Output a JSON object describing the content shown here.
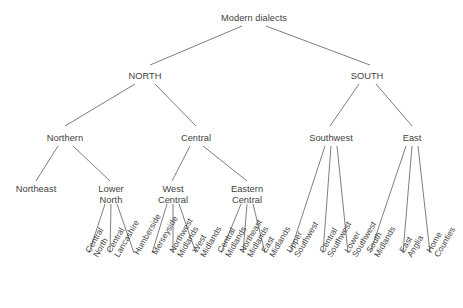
{
  "diagram": {
    "type": "tree",
    "title": "Modern dialects",
    "background_color": "#ffffff",
    "line_color": "#6f6f6f",
    "text_color": "#3f3f3f",
    "leaf_label_rotation_deg": -60,
    "nodes": {
      "root": "Modern dialects",
      "level2": [
        "NORTH",
        "SOUTH"
      ],
      "level3": [
        "Northern",
        "Central",
        "Southwest",
        "East"
      ],
      "level4": [
        "Northeast",
        "Lower North",
        "West Central",
        "Eastern Central"
      ],
      "level4_lines": {
        "northeast": [
          "Northeast"
        ],
        "lower_north": [
          "Lower",
          "North"
        ],
        "west_central": [
          "West",
          "Central"
        ],
        "eastern_central": [
          "Eastern",
          "Central"
        ]
      },
      "leaves": [
        "Central North",
        "Central Lancashire",
        "Humberside",
        "Merseyside",
        "Northwest Midlands",
        "West Midlands",
        "Central Midlands",
        "Northeast Midlands",
        "East Midlands",
        "Upper Southwest",
        "Central Southwest",
        "Lower Southwest",
        "South Midlands",
        "East Anglia",
        "Home Counties"
      ],
      "leaf_lines": [
        [
          "Central",
          "North"
        ],
        [
          "Central",
          "Lancashire"
        ],
        [
          "Humberside"
        ],
        [
          "Merseyside"
        ],
        [
          "Northwest",
          "Midlands"
        ],
        [
          "West",
          "Midlands"
        ],
        [
          "Central",
          "Midlands"
        ],
        [
          "Northeast",
          "Midlands"
        ],
        [
          "East",
          "Midlands"
        ],
        [
          "Upper",
          "Southwest"
        ],
        [
          "Central",
          "Southwest"
        ],
        [
          "Lower",
          "Southwest"
        ],
        [
          "South",
          "Midlands"
        ],
        [
          "East",
          "Anglia"
        ],
        [
          "Home",
          "Counties"
        ]
      ]
    },
    "edges": [
      [
        "Modern dialects",
        "NORTH"
      ],
      [
        "Modern dialects",
        "SOUTH"
      ],
      [
        "NORTH",
        "Northern"
      ],
      [
        "NORTH",
        "Central"
      ],
      [
        "SOUTH",
        "Southwest"
      ],
      [
        "SOUTH",
        "East"
      ],
      [
        "Northern",
        "Northeast"
      ],
      [
        "Northern",
        "Lower North"
      ],
      [
        "Central",
        "West Central"
      ],
      [
        "Central",
        "Eastern Central"
      ],
      [
        "Lower North",
        "Central North"
      ],
      [
        "Lower North",
        "Central Lancashire"
      ],
      [
        "Lower North",
        "Humberside"
      ],
      [
        "West Central",
        "Merseyside"
      ],
      [
        "West Central",
        "Northwest Midlands"
      ],
      [
        "West Central",
        "West Midlands"
      ],
      [
        "Eastern Central",
        "Central Midlands"
      ],
      [
        "Eastern Central",
        "Northeast Midlands"
      ],
      [
        "Eastern Central",
        "East Midlands"
      ],
      [
        "Southwest",
        "Upper Southwest"
      ],
      [
        "Southwest",
        "Central Southwest"
      ],
      [
        "Southwest",
        "Lower Southwest"
      ],
      [
        "East",
        "South Midlands"
      ],
      [
        "East",
        "East Anglia"
      ],
      [
        "East",
        "Home Counties"
      ]
    ]
  }
}
